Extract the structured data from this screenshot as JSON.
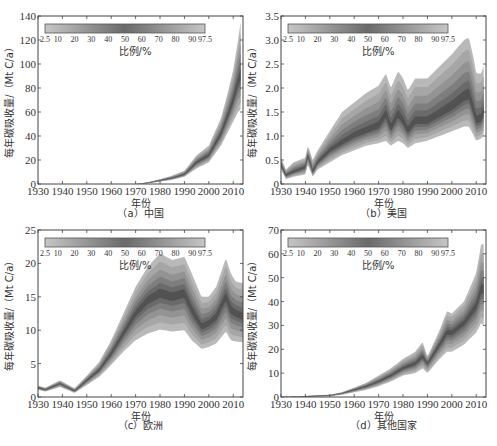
{
  "figure": {
    "shared": {
      "xlabel": "年份",
      "ylabel": "每年碳吸收量/（Mt C/a）",
      "colorbar": {
        "title": "比例/%",
        "ticks": [
          "2.5",
          "10",
          "20",
          "30",
          "40",
          "50",
          "60",
          "70",
          "80",
          "90",
          "97.5"
        ]
      }
    }
  },
  "chart_data": [
    {
      "id": "a",
      "type": "area",
      "caption": "（a）中国",
      "title": "中国",
      "xlabel": "年份",
      "ylabel": "每年碳吸收量/（Mt C/a）",
      "xlim": [
        1930,
        2014
      ],
      "ylim": [
        0,
        140
      ],
      "xticks": [
        1930,
        1940,
        1950,
        1960,
        1970,
        1980,
        1990,
        2000,
        2010
      ],
      "yticks": [
        0,
        20,
        40,
        60,
        80,
        100,
        120,
        140
      ],
      "grid": false,
      "legend": {
        "type": "colorbar",
        "title": "比例/%",
        "position": "top-left",
        "ticks": [
          "2.5",
          "10",
          "20",
          "30",
          "40",
          "50",
          "60",
          "70",
          "80",
          "90",
          "97.5"
        ]
      },
      "x": [
        1930,
        1970,
        1975,
        1980,
        1985,
        1990,
        1995,
        2000,
        2005,
        2008,
        2010,
        2012,
        2013
      ],
      "series": [
        {
          "name": "97.5%",
          "values": [
            0,
            0,
            1.5,
            4,
            7,
            11,
            24,
            32,
            55,
            78,
            95,
            120,
            135
          ]
        },
        {
          "name": "50%",
          "values": [
            0,
            0,
            1,
            3,
            5,
            8,
            18,
            24,
            42,
            58,
            70,
            85,
            90
          ]
        },
        {
          "name": "2.5%",
          "values": [
            0,
            0,
            0.5,
            2,
            3.5,
            6,
            13,
            18,
            32,
            44,
            52,
            60,
            62
          ]
        }
      ]
    },
    {
      "id": "b",
      "type": "area",
      "caption": "（b）美国",
      "title": "美国",
      "xlabel": "年份",
      "ylabel": "每年碳吸收量/（Mt C/a）",
      "xlim": [
        1930,
        2014
      ],
      "ylim": [
        0,
        3.5
      ],
      "xticks": [
        1930,
        1940,
        1950,
        1960,
        1970,
        1980,
        1990,
        2000,
        2010
      ],
      "yticks": [
        0,
        0.5,
        1.0,
        1.5,
        2.0,
        2.5,
        3.0,
        3.5
      ],
      "grid": false,
      "legend": {
        "type": "colorbar",
        "title": "比例/%",
        "position": "top-left",
        "ticks": [
          "2.5",
          "10",
          "20",
          "30",
          "40",
          "50",
          "60",
          "70",
          "80",
          "90",
          "97.5"
        ]
      },
      "x": [
        1930,
        1932,
        1935,
        1940,
        1941,
        1943,
        1945,
        1950,
        1955,
        1960,
        1965,
        1970,
        1973,
        1975,
        1978,
        1980,
        1982,
        1985,
        1990,
        1995,
        2000,
        2005,
        2007,
        2009,
        2010,
        2012,
        2013
      ],
      "series": [
        {
          "name": "97.5%",
          "values": [
            0.55,
            0.3,
            0.45,
            0.55,
            0.8,
            0.5,
            0.7,
            1.1,
            1.5,
            1.7,
            1.9,
            2.05,
            2.3,
            2.0,
            2.35,
            2.2,
            1.95,
            2.2,
            2.2,
            2.45,
            2.7,
            3.0,
            3.05,
            2.6,
            2.3,
            2.3,
            2.45
          ]
        },
        {
          "name": "50%",
          "values": [
            0.4,
            0.18,
            0.25,
            0.35,
            0.6,
            0.25,
            0.45,
            0.7,
            0.85,
            1.0,
            1.1,
            1.2,
            1.45,
            1.15,
            1.45,
            1.3,
            1.1,
            1.3,
            1.3,
            1.45,
            1.6,
            1.8,
            1.85,
            1.5,
            1.3,
            1.35,
            1.5
          ]
        },
        {
          "name": "2.5%",
          "values": [
            0.3,
            0.1,
            0.15,
            0.2,
            0.4,
            0.15,
            0.3,
            0.45,
            0.6,
            0.7,
            0.8,
            0.85,
            0.9,
            0.8,
            0.9,
            0.85,
            0.75,
            0.85,
            0.9,
            1.0,
            1.1,
            1.2,
            1.2,
            1.0,
            0.9,
            0.95,
            1.0
          ]
        }
      ]
    },
    {
      "id": "c",
      "type": "area",
      "caption": "（c）欧洲",
      "title": "欧洲",
      "xlabel": "年份",
      "ylabel": "每年碳吸收量/（Mt C/a）",
      "xlim": [
        1930,
        2014
      ],
      "ylim": [
        0,
        25
      ],
      "xticks": [
        1930,
        1940,
        1950,
        1960,
        1970,
        1980,
        1990,
        2000,
        2010
      ],
      "yticks": [
        0,
        5,
        10,
        15,
        20,
        25
      ],
      "grid": false,
      "legend": {
        "type": "colorbar",
        "title": "比例/%",
        "position": "top-left",
        "ticks": [
          "2.5",
          "10",
          "20",
          "30",
          "40",
          "50",
          "60",
          "70",
          "80",
          "90",
          "97.5"
        ]
      },
      "x": [
        1930,
        1933,
        1939,
        1945,
        1950,
        1955,
        1960,
        1965,
        1970,
        1975,
        1980,
        1985,
        1990,
        1993,
        1997,
        2000,
        2003,
        2007,
        2009,
        2011,
        2014
      ],
      "series": [
        {
          "name": "97.5%",
          "values": [
            1.7,
            1.4,
            2.5,
            1.3,
            3.2,
            5.2,
            8.5,
            12.5,
            16.5,
            19.5,
            21.5,
            20.5,
            21.0,
            18.5,
            15.0,
            15.0,
            16.5,
            20.8,
            18.5,
            17.3,
            17.0
          ]
        },
        {
          "name": "50%",
          "values": [
            1.4,
            1.1,
            2.0,
            0.9,
            2.5,
            4.0,
            6.5,
            9.5,
            12.5,
            14.5,
            15.5,
            15.0,
            15.5,
            13.0,
            10.5,
            11.0,
            12.0,
            15.0,
            13.0,
            12.5,
            12.0
          ]
        },
        {
          "name": "2.5%",
          "values": [
            1.1,
            0.8,
            1.5,
            0.6,
            1.8,
            3.0,
            4.8,
            6.8,
            8.5,
            9.5,
            10.1,
            9.8,
            10.0,
            8.5,
            7.2,
            7.5,
            8.0,
            9.8,
            8.5,
            8.3,
            8.2
          ]
        }
      ]
    },
    {
      "id": "d",
      "type": "area",
      "caption": "（d）其他国家",
      "title": "其他国家",
      "xlabel": "年份",
      "ylabel": "每年碳吸收量/（Mt C/a）",
      "xlim": [
        1930,
        2014
      ],
      "ylim": [
        0,
        70
      ],
      "xticks": [
        1930,
        1940,
        1950,
        1960,
        1970,
        1980,
        1990,
        2000,
        2010
      ],
      "yticks": [
        0,
        10,
        20,
        30,
        40,
        50,
        60,
        70
      ],
      "grid": false,
      "legend": {
        "type": "colorbar",
        "title": "比例/%",
        "position": "top-left",
        "ticks": [
          "2.5",
          "10",
          "20",
          "30",
          "40",
          "50",
          "60",
          "70",
          "80",
          "90",
          "97.5"
        ]
      },
      "x": [
        1930,
        1940,
        1950,
        1955,
        1960,
        1965,
        1970,
        1975,
        1980,
        1985,
        1988,
        1990,
        1995,
        1998,
        2000,
        2005,
        2010,
        2012,
        2013
      ],
      "series": [
        {
          "name": "97.5%",
          "values": [
            0,
            0.5,
            1,
            2,
            4,
            6,
            9,
            12,
            16,
            19,
            23,
            17,
            28,
            36,
            35,
            40,
            52,
            64,
            64
          ]
        },
        {
          "name": "50%",
          "values": [
            0,
            0.3,
            0.6,
            1.5,
            3,
            4.5,
            6.5,
            9,
            12,
            14,
            17,
            14,
            22,
            27,
            27,
            31,
            38,
            45,
            45
          ]
        },
        {
          "name": "2.5%",
          "values": [
            0,
            0.1,
            0.3,
            1,
            2,
            3,
            4.5,
            6.5,
            9,
            10,
            12,
            10,
            16,
            19,
            19,
            22,
            27,
            31,
            30
          ]
        }
      ]
    }
  ]
}
